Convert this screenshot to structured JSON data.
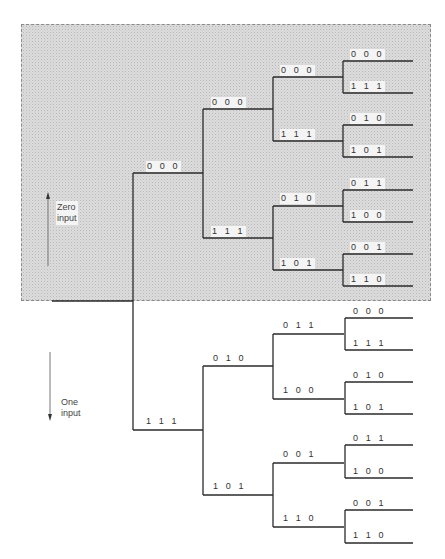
{
  "diagram": {
    "type": "binary code tree (convolutional encoder)",
    "legend": {
      "zero_input": {
        "label": "Zero\ninput",
        "direction": "up"
      },
      "one_input": {
        "label": "One\ninput",
        "direction": "down"
      }
    },
    "shaded_region": "zero-input subtree",
    "levels": {
      "level1": [
        {
          "id": "u",
          "label": "0 0 0"
        },
        {
          "id": "l",
          "label": "1 1 1"
        }
      ],
      "level2": [
        {
          "id": "uu",
          "label": "0 0 0"
        },
        {
          "id": "ul",
          "label": "1 1 1"
        },
        {
          "id": "lu",
          "label": "0 1 0"
        },
        {
          "id": "ll",
          "label": "1 0 1"
        }
      ],
      "level3": [
        {
          "id": "uuu",
          "label": "0 0 0"
        },
        {
          "id": "uul",
          "label": "1 1 1"
        },
        {
          "id": "ulu",
          "label": "0 1 0"
        },
        {
          "id": "ull",
          "label": "1 0 1"
        },
        {
          "id": "luu",
          "label": "0 1 1"
        },
        {
          "id": "lul",
          "label": "1 0 0"
        },
        {
          "id": "llu",
          "label": "0 0 1"
        },
        {
          "id": "lll",
          "label": "1 1 0"
        }
      ],
      "level4": [
        {
          "label": "0 0 0"
        },
        {
          "label": "1 1 1"
        },
        {
          "label": "0 1 0"
        },
        {
          "label": "1 0 1"
        },
        {
          "label": "0 1 1"
        },
        {
          "label": "1 0 0"
        },
        {
          "label": "0 0 1"
        },
        {
          "label": "1 1 0"
        },
        {
          "label": "0 0 0"
        },
        {
          "label": "1 1 1"
        },
        {
          "label": "0 1 0"
        },
        {
          "label": "1 0 1"
        },
        {
          "label": "0 1 1"
        },
        {
          "label": "1 0 0"
        },
        {
          "label": "0 0 1"
        },
        {
          "label": "1 1 0"
        }
      ]
    },
    "colors": {
      "line": "#2a2a2a",
      "shade": "#dcdcdc",
      "arrow": "#777777"
    }
  }
}
